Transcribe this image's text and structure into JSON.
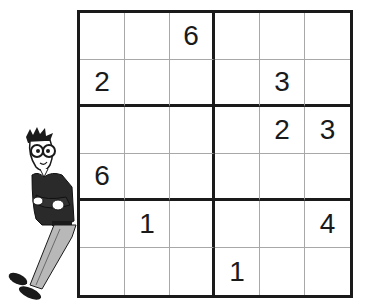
{
  "puzzle": {
    "type": "sudoku-6x6",
    "box_rows": 2,
    "box_cols": 3,
    "grid": [
      [
        "",
        "",
        "6",
        "",
        "",
        ""
      ],
      [
        "2",
        "",
        "",
        "",
        "3",
        ""
      ],
      [
        "",
        "",
        "",
        "",
        "2",
        "3"
      ],
      [
        "6",
        "",
        "",
        "",
        "",
        ""
      ],
      [
        "",
        "1",
        "",
        "",
        "",
        "4"
      ],
      [
        "",
        "",
        "",
        "1",
        "",
        ""
      ]
    ]
  },
  "colors": {
    "thick_line": "#1a1a1a",
    "thin_line": "#a8a8a8",
    "digit": "#1a1a1a",
    "background": "#ffffff",
    "pants": "#b8b8b8"
  },
  "illustration": {
    "character": "cartoon-man-leaning-on-grid"
  }
}
